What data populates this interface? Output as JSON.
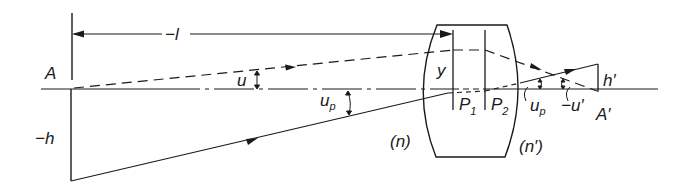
{
  "diagram": {
    "type": "optical-system-ray-diagram",
    "labels": {
      "object_point": "A",
      "object_distance": "−l",
      "object_height": "−h",
      "aperture_angle": "u",
      "pupil_angle": "u",
      "pupil_angle_sub": "p",
      "ray_height": "y",
      "principal_plane_1": "P",
      "principal_plane_1_sub": "1",
      "principal_plane_2": "P",
      "principal_plane_2_sub": "2",
      "image_pupil_angle": "u",
      "image_pupil_angle_sub": "p",
      "image_angle": "−u′",
      "image_point": "A′",
      "image_height": "h′",
      "object_index": "(n)",
      "image_index": "(n′)"
    },
    "colors": {
      "stroke": "#1a1a1a",
      "background": "#ffffff"
    }
  }
}
